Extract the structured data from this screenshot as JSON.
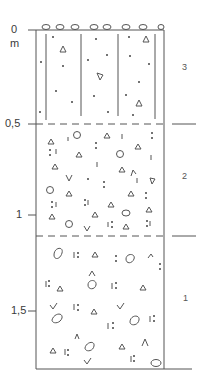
{
  "diagram": {
    "type": "soil-profile",
    "unit_label": "m",
    "depth_ticks": [
      {
        "label": "0",
        "y": 30
      },
      {
        "label": "0,5",
        "y": 124
      },
      {
        "label": "1",
        "y": 215
      },
      {
        "label": "1,5",
        "y": 311
      }
    ],
    "layers": [
      {
        "id": "3",
        "label": "3",
        "top_y": 30,
        "bottom_y": 124,
        "pattern": "vertical lines with dots and triangles, pebbles at surface"
      },
      {
        "id": "2",
        "label": "2",
        "top_y": 124,
        "bottom_y": 236,
        "pattern": "dense mixed symbols: triangles, dots, circles, v-marks"
      },
      {
        "id": "1",
        "label": "1",
        "top_y": 236,
        "bottom_y": 369,
        "pattern": "large circles, colon-dot marks, triangles, v-marks"
      }
    ],
    "colors": {
      "line": "#555555",
      "symbol": "#555555",
      "text": "#3a3a3a"
    }
  }
}
